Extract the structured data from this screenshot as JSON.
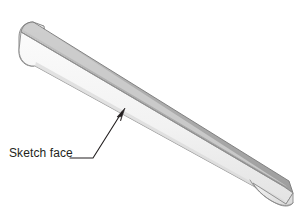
{
  "figure": {
    "kind": "3d-isometric-solid",
    "object_name": "tapered-rectangular-bar",
    "background_color": "#ffffff",
    "faces": {
      "top_face_color": "#a9a9a9",
      "top_face_highlight_color": "#c4c4c4",
      "front_face_color": "#f4f4f4",
      "front_face_shade_color": "#e2e2e2",
      "end_cap_color": "#ededed",
      "outline_color": "#6e6e6e"
    }
  },
  "annotation": {
    "label": "Sketch face",
    "leader_color": "#231f20",
    "arrow_target_description": "front planar face of bar",
    "arrow_tip": {
      "x": 124,
      "y": 110
    },
    "leader_elbow": {
      "x": 93,
      "y": 158
    },
    "leader_end": {
      "x": 70,
      "y": 158
    }
  },
  "canvas": {
    "width": 304,
    "height": 224
  }
}
